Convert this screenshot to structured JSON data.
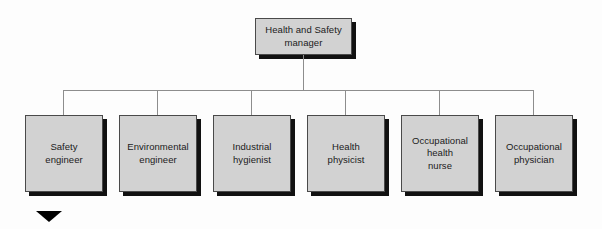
{
  "diagram": {
    "type": "organizational-chart",
    "colors": {
      "box_fill": "#d2d2d2",
      "box_border": "#4a4a4a",
      "box_shadow": "#111111",
      "connector": "#8d8d8d",
      "text": "#1b1b1b",
      "marker": "#000000",
      "background": "#fdfdfd"
    },
    "root": {
      "label": "Health and Safety\nmanager"
    },
    "children": [
      {
        "label": "Safety\nengineer"
      },
      {
        "label": "Environmental\nengineer"
      },
      {
        "label": "Industrial\nhygienist"
      },
      {
        "label": "Health\nphysicist"
      },
      {
        "label": "Occupational\nhealth\nnurse"
      },
      {
        "label": "Occupational\nphysician"
      }
    ],
    "marker": {
      "name": "down-triangle-marker",
      "glyph": "▼"
    }
  }
}
